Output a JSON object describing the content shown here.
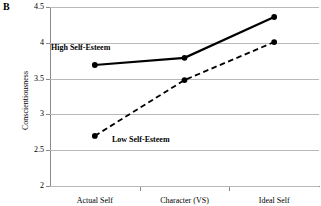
{
  "figure": {
    "panel_label": "B"
  },
  "chart_data": {
    "type": "line",
    "title": "",
    "xlabel": "",
    "ylabel": "Conscientiousness",
    "categories": [
      "Actual Self",
      "Character (VS)",
      "Ideal Self"
    ],
    "series": [
      {
        "name": "High Self-Esteem",
        "values": [
          3.69,
          3.79,
          4.36
        ],
        "style": "solid",
        "color": "#000000",
        "marker": "filled-circle",
        "line_width": 2.2
      },
      {
        "name": "Low Self-Esteem",
        "values": [
          2.7,
          3.48,
          4.01
        ],
        "style": "dashed",
        "color": "#000000",
        "marker": "filled-circle",
        "line_width": 1.8
      }
    ],
    "ylim": [
      2,
      4.5
    ],
    "yticks": [
      2,
      2.5,
      3,
      3.5,
      4,
      4.5
    ],
    "ytick_labels": [
      "2",
      "2.5",
      "3",
      "3.5",
      "4",
      "4.5"
    ],
    "grid": true,
    "grid_axis": "y",
    "grid_color": "#b9b9b9",
    "legend": "inline-annotations",
    "annotations": [
      {
        "text": "High Self-Esteem",
        "series": "High Self-Esteem"
      },
      {
        "text": "Low Self-Esteem",
        "series": "Low Self-Esteem"
      }
    ]
  }
}
